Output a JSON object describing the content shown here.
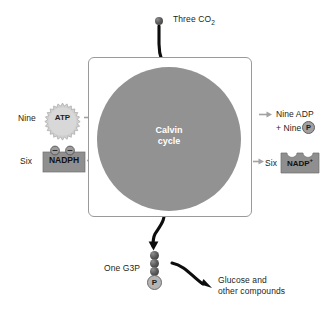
{
  "diagram": {
    "title": "Calvin cycle",
    "center_label_line1": "Calvin",
    "center_label_line2": "cycle",
    "background_color": "#ffffff",
    "circle_color": "#929292",
    "arrow_color_input": "#9a9a9a",
    "arrow_color_main": "#000000"
  },
  "inputs": {
    "co2": {
      "label": "Three CO",
      "subscript": "2",
      "full_label": "Three CO2",
      "icon": "carbon-sphere"
    },
    "atp": {
      "count_label": "Nine",
      "molecule_label": "ATP",
      "icon": "starburst-badge"
    },
    "nadph": {
      "count_label": "Six",
      "molecule_label": "NADPH",
      "icon": "electron-carrier-box"
    }
  },
  "outputs": {
    "adp": {
      "line1": "Nine ADP",
      "line2_prefix": "+ Nine",
      "phosphate_symbol": "P"
    },
    "nadp_plus": {
      "count_label": "Six",
      "molecule_label": "NADP",
      "charge": "+",
      "icon": "empty-carrier-box"
    },
    "g3p": {
      "label": "One G3P",
      "phosphate_symbol": "P",
      "carbon_count": 3
    },
    "glucose": {
      "line1": "Glucose and",
      "line2": "other compounds"
    }
  }
}
